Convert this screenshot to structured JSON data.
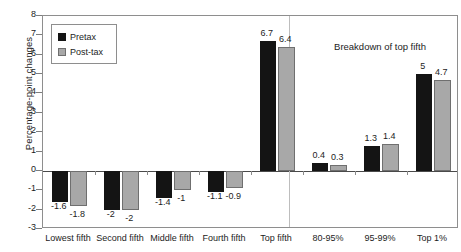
{
  "chart_data": {
    "type": "bar",
    "title": "",
    "xlabel": "",
    "ylabel": "Percentage-point changes",
    "ylim": [
      -3,
      8
    ],
    "yticks": [
      8,
      7,
      6,
      5,
      4,
      3,
      2,
      1,
      0,
      -1,
      -2,
      -3
    ],
    "grid": false,
    "legend_position": "top-left",
    "categories": [
      "Lowest fifth",
      "Second fifth",
      "Middle fifth",
      "Fourth fifth",
      "Top fifth",
      "80-95%",
      "95-99%",
      "Top 1%"
    ],
    "series": [
      {
        "name": "Pretax",
        "color": "#141414",
        "values": [
          -1.6,
          -2,
          -1.4,
          -1.1,
          6.7,
          0.4,
          1.3,
          5
        ]
      },
      {
        "name": "Post-tax",
        "color": "#a8a8a8",
        "values": [
          -1.8,
          -2,
          -1,
          -0.9,
          6.4,
          0.3,
          1.4,
          4.7
        ]
      }
    ],
    "data_labels": {
      "Pretax": [
        "-1.6",
        "-2",
        "-1.4",
        "-1.1",
        "6.7",
        "0.4",
        "1.3",
        "5"
      ],
      "Post-tax": [
        "-1.8",
        "-2",
        "-1",
        "-0.9",
        "6.4",
        "0.3",
        "1.4",
        "4.7"
      ]
    },
    "annotations": [
      {
        "text": "Breakdown of top fifth",
        "x_category": "95-99%",
        "y": 7
      }
    ],
    "separators": [
      {
        "type": "vertical",
        "after_category": "Top fifth"
      }
    ]
  },
  "legend": {
    "items": [
      {
        "label": "Pretax",
        "swatch": "black-square"
      },
      {
        "label": "Post-tax",
        "swatch": "gray-square"
      }
    ]
  },
  "axis": {
    "y_title": "Percentage-point changes",
    "y_tick_labels": [
      "8",
      "7",
      "6",
      "5",
      "4",
      "3",
      "2",
      "1",
      "0",
      "-1",
      "-2",
      "-3"
    ]
  }
}
